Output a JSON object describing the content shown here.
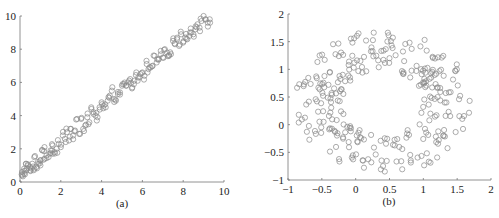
{
  "chart_data": [
    {
      "type": "scatter",
      "title": "",
      "caption": "(a)",
      "xlabel": "",
      "ylabel": "",
      "xlim": [
        0,
        10
      ],
      "ylim": [
        0,
        10
      ],
      "xticks": [
        "0",
        "2",
        "4",
        "6",
        "8",
        "10"
      ],
      "yticks": [
        "0",
        "2",
        "4",
        "6",
        "8",
        "10"
      ],
      "grid": false,
      "marker": "open-circle",
      "description": "Approximately 200 points along the line y ≈ x + 0.5 with small noise, x from 0 to ~9.3",
      "points": [
        [
          0.1,
          0.6
        ],
        [
          0.1,
          0.4
        ],
        [
          0.2,
          0.8
        ],
        [
          0.2,
          0.5
        ],
        [
          0.3,
          1.1
        ],
        [
          0.3,
          0.7
        ],
        [
          0.4,
          1.0
        ],
        [
          0.5,
          0.9
        ],
        [
          0.5,
          0.7
        ],
        [
          0.6,
          1.1
        ],
        [
          0.7,
          0.8
        ],
        [
          0.7,
          1.5
        ],
        [
          0.8,
          0.9
        ],
        [
          0.9,
          1.1
        ],
        [
          1.0,
          1.0
        ],
        [
          1.0,
          1.3
        ],
        [
          1.1,
          1.9
        ],
        [
          1.2,
          1.4
        ],
        [
          1.2,
          2.1
        ],
        [
          1.3,
          1.6
        ],
        [
          1.4,
          1.5
        ],
        [
          1.5,
          1.9
        ],
        [
          1.6,
          1.7
        ],
        [
          1.6,
          2.2
        ],
        [
          1.7,
          1.8
        ],
        [
          1.8,
          2.0
        ],
        [
          1.9,
          2.3
        ],
        [
          2.0,
          2.1
        ],
        [
          2.1,
          2.8
        ],
        [
          2.2,
          2.6
        ],
        [
          2.3,
          3.0
        ],
        [
          2.4,
          2.5
        ],
        [
          2.5,
          3.2
        ],
        [
          2.6,
          2.8
        ],
        [
          2.7,
          3.1
        ],
        [
          2.8,
          3.8
        ],
        [
          2.9,
          2.9
        ],
        [
          3.0,
          3.8
        ],
        [
          3.1,
          3.2
        ],
        [
          3.2,
          3.4
        ],
        [
          3.3,
          3.9
        ],
        [
          3.4,
          3.6
        ],
        [
          3.5,
          4.4
        ],
        [
          3.6,
          4.1
        ],
        [
          3.7,
          4.0
        ],
        [
          3.8,
          3.9
        ],
        [
          3.9,
          4.5
        ],
        [
          4.0,
          4.8
        ],
        [
          4.1,
          4.6
        ],
        [
          4.2,
          4.5
        ],
        [
          4.3,
          4.9
        ],
        [
          4.4,
          5.2
        ],
        [
          4.5,
          5.5
        ],
        [
          4.6,
          5.0
        ],
        [
          4.7,
          4.9
        ],
        [
          4.8,
          5.3
        ],
        [
          4.9,
          5.4
        ],
        [
          5.0,
          5.8
        ],
        [
          5.1,
          5.9
        ],
        [
          5.2,
          5.8
        ],
        [
          5.3,
          6.0
        ],
        [
          5.4,
          6.2
        ],
        [
          5.5,
          5.7
        ],
        [
          5.6,
          6.1
        ],
        [
          5.7,
          6.6
        ],
        [
          5.8,
          6.3
        ],
        [
          5.9,
          6.5
        ],
        [
          6.0,
          6.6
        ],
        [
          6.1,
          6.4
        ],
        [
          6.2,
          7.3
        ],
        [
          6.3,
          6.8
        ],
        [
          6.4,
          6.9
        ],
        [
          6.5,
          7.0
        ],
        [
          6.6,
          7.6
        ],
        [
          6.7,
          7.2
        ],
        [
          6.8,
          7.4
        ],
        [
          6.9,
          7.9
        ],
        [
          7.0,
          7.5
        ],
        [
          7.1,
          8.0
        ],
        [
          7.2,
          7.8
        ],
        [
          7.3,
          7.6
        ],
        [
          7.4,
          7.7
        ],
        [
          7.5,
          8.5
        ],
        [
          7.6,
          8.3
        ],
        [
          7.7,
          8.6
        ],
        [
          7.8,
          8.2
        ],
        [
          7.9,
          8.9
        ],
        [
          8.0,
          8.4
        ],
        [
          8.1,
          8.7
        ],
        [
          8.2,
          8.6
        ],
        [
          8.3,
          8.8
        ],
        [
          8.4,
          9.0
        ],
        [
          8.5,
          8.9
        ],
        [
          8.6,
          9.2
        ],
        [
          8.7,
          9.5
        ],
        [
          8.8,
          9.3
        ],
        [
          8.9,
          9.7
        ],
        [
          9.0,
          10.0
        ],
        [
          9.1,
          9.8
        ],
        [
          9.2,
          9.6
        ],
        [
          9.3,
          9.8
        ]
      ]
    },
    {
      "type": "scatter",
      "title": "",
      "caption": "(b)",
      "xlabel": "",
      "ylabel": "",
      "xlim": [
        -1,
        2
      ],
      "ylim": [
        -1,
        2
      ],
      "xticks": [
        "−1",
        "−0.5",
        "0",
        "0.5",
        "1",
        "1.5",
        "2"
      ],
      "yticks": [
        "−1",
        "−0.5",
        "0",
        "0.5",
        "1",
        "1.5",
        "2"
      ],
      "grid": false,
      "marker": "open-circle",
      "description": "Approximately 300 points forming a ring (annulus) centered near (0.4, 0.4) with inner radius ~0.6 and outer radius ~1.3",
      "ring": {
        "center": [
          0.4,
          0.4
        ],
        "inner_radius": 0.6,
        "outer_radius": 1.3,
        "count": 300
      }
    }
  ]
}
